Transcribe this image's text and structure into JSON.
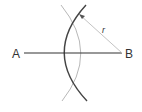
{
  "diagram": {
    "type": "geometric-construction",
    "points": {
      "A": {
        "label": "A",
        "x": 24,
        "y": 53
      },
      "B": {
        "label": "B",
        "x": 122,
        "y": 53
      }
    },
    "segment": {
      "from": "A",
      "to": "B"
    },
    "radius_label": "r",
    "colors": {
      "segment": "#333333",
      "dark_arc": "#444444",
      "light_arc": "#b8b8b8",
      "radius_line": "#c4c4c4",
      "text": "#333333"
    }
  }
}
